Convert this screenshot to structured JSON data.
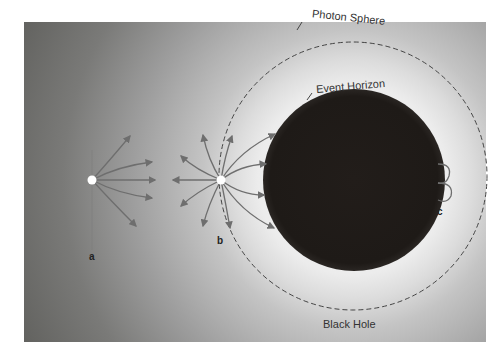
{
  "diagram": {
    "title": "Black Hole",
    "labels": {
      "photon_sphere": "Photon Sphere",
      "event_horizon": "Event Horizon",
      "black_hole": "Black Hole"
    },
    "points": {
      "a": "a",
      "b": "b",
      "c": "c"
    },
    "colors": {
      "background_dark": "#545451",
      "glow": "#f4f4f4",
      "black_hole": "#1e1a17",
      "arrows": "#6e6e6e",
      "dashed_circle": "#444444",
      "light_source": "#ffffff"
    }
  }
}
